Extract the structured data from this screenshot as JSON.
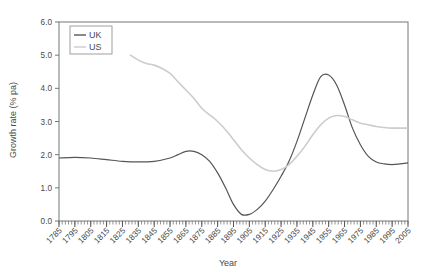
{
  "chart_data": {
    "type": "line",
    "title": "",
    "xlabel": "Year",
    "ylabel": "Growth rate (% pa)",
    "xlim": [
      1785,
      2005
    ],
    "ylim": [
      0.0,
      6.0
    ],
    "grid": false,
    "legend_position": "top-left",
    "y_ticks": [
      "0.0",
      "1.0",
      "2.0",
      "3.0",
      "4.0",
      "5.0",
      "6.0"
    ],
    "y_tick_values": [
      0.0,
      1.0,
      2.0,
      3.0,
      4.0,
      5.0,
      6.0
    ],
    "x_ticks": [
      "1785",
      "1795",
      "1805",
      "1815",
      "1825",
      "1835",
      "1845",
      "1855",
      "1865",
      "1875",
      "1885",
      "1895",
      "1905",
      "1915",
      "1925",
      "1935",
      "1945",
      "1955",
      "1965",
      "1975",
      "1985",
      "1995",
      "2005"
    ],
    "x_tick_values": [
      1785,
      1795,
      1805,
      1815,
      1825,
      1835,
      1845,
      1855,
      1865,
      1875,
      1885,
      1895,
      1905,
      1915,
      1925,
      1935,
      1945,
      1955,
      1965,
      1975,
      1985,
      1995,
      2005
    ],
    "x_minor_step": 2,
    "series": [
      {
        "name": "UK",
        "color": "#555555",
        "x": [
          1785,
          1795,
          1805,
          1815,
          1825,
          1835,
          1845,
          1855,
          1860,
          1865,
          1870,
          1875,
          1880,
          1885,
          1890,
          1895,
          1900,
          1905,
          1910,
          1915,
          1920,
          1925,
          1930,
          1935,
          1940,
          1945,
          1950,
          1955,
          1960,
          1965,
          1970,
          1975,
          1980,
          1985,
          1990,
          1995,
          2000,
          2005
        ],
        "y": [
          1.9,
          1.92,
          1.9,
          1.85,
          1.8,
          1.78,
          1.8,
          1.9,
          2.0,
          2.1,
          2.1,
          2.0,
          1.8,
          1.45,
          1.0,
          0.5,
          0.2,
          0.2,
          0.35,
          0.6,
          0.95,
          1.35,
          1.8,
          2.4,
          3.1,
          3.8,
          4.35,
          4.4,
          4.1,
          3.5,
          2.8,
          2.3,
          1.95,
          1.78,
          1.72,
          1.7,
          1.72,
          1.75
        ]
      },
      {
        "name": "US",
        "color": "#cccccc",
        "x": [
          1830,
          1835,
          1840,
          1845,
          1850,
          1855,
          1860,
          1865,
          1870,
          1875,
          1880,
          1885,
          1890,
          1895,
          1900,
          1905,
          1910,
          1915,
          1920,
          1925,
          1930,
          1935,
          1940,
          1945,
          1950,
          1955,
          1960,
          1965,
          1970,
          1975,
          1980,
          1985,
          1990,
          1995,
          2000,
          2005
        ],
        "y": [
          5.0,
          4.85,
          4.75,
          4.7,
          4.6,
          4.45,
          4.2,
          3.95,
          3.7,
          3.4,
          3.2,
          3.0,
          2.75,
          2.45,
          2.15,
          1.9,
          1.7,
          1.55,
          1.5,
          1.55,
          1.7,
          1.95,
          2.25,
          2.6,
          2.9,
          3.1,
          3.18,
          3.15,
          3.05,
          2.95,
          2.9,
          2.85,
          2.82,
          2.8,
          2.8,
          2.8
        ]
      }
    ]
  },
  "legend": {
    "items": [
      {
        "label": "UK",
        "color": "#555555"
      },
      {
        "label": "US",
        "color": "#cccccc"
      }
    ]
  },
  "axes": {
    "y_axis_title": "Growth rate (% pa)",
    "x_axis_title": "Year"
  }
}
